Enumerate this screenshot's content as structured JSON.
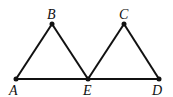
{
  "diagram": {
    "type": "geometry",
    "points": {
      "A": {
        "label": "A",
        "x": 16,
        "y": 79
      },
      "B": {
        "label": "B",
        "x": 52,
        "y": 24
      },
      "E": {
        "label": "E",
        "x": 88,
        "y": 79
      },
      "C": {
        "label": "C",
        "x": 124,
        "y": 24
      },
      "D": {
        "label": "D",
        "x": 159,
        "y": 79
      }
    },
    "segments": [
      "AB",
      "BE",
      "EC",
      "CD",
      "AD"
    ],
    "stroke_color": "#111111"
  }
}
